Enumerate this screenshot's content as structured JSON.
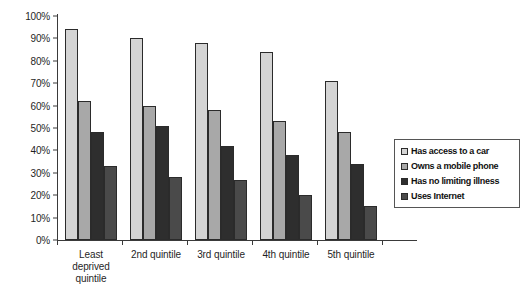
{
  "chart_data": {
    "type": "bar",
    "title": "",
    "subtitle": "",
    "xlabel": "",
    "ylabel": "",
    "ylim": [
      0,
      100
    ],
    "ytick_labels": [
      "100%",
      "90%",
      "80%",
      "70%",
      "60%",
      "50%",
      "40%",
      "30%",
      "20%",
      "10%",
      "0%"
    ],
    "ytick_values": [
      100,
      90,
      80,
      70,
      60,
      50,
      40,
      30,
      20,
      10,
      0
    ],
    "grid": false,
    "legend_position": "right",
    "categories": [
      "Least deprived quintile",
      "2nd quintile",
      "3rd quintile",
      "4th quintile",
      "5th quintile"
    ],
    "category_label_lines": [
      [
        "Least",
        "deprived",
        "quintile"
      ],
      [
        "2nd quintile"
      ],
      [
        "3rd quintile"
      ],
      [
        "4th quintile"
      ],
      [
        "5th quintile"
      ]
    ],
    "series": [
      {
        "name": "Has access to a car",
        "color": "#d4d4d4",
        "values": [
          94,
          90,
          88,
          84,
          71
        ]
      },
      {
        "name": "Owns a mobile phone",
        "color": "#a8a8a8",
        "values": [
          62,
          60,
          58,
          53,
          48
        ]
      },
      {
        "name": "Has no limiting illness",
        "color": "#2e2e2e",
        "values": [
          48,
          51,
          42,
          38,
          34
        ]
      },
      {
        "name": "Uses Internet",
        "color": "#4a4a4a",
        "values": [
          33,
          28,
          27,
          20,
          15
        ]
      }
    ]
  },
  "legend": {
    "items": [
      {
        "label": "Has access to a car",
        "swatch": "#d4d4d4"
      },
      {
        "label": "Owns a mobile phone",
        "swatch": "#a8a8a8"
      },
      {
        "label": "Has no limiting illness",
        "swatch": "#2e2e2e"
      },
      {
        "label": "Uses Internet",
        "swatch": "#4a4a4a"
      }
    ]
  }
}
